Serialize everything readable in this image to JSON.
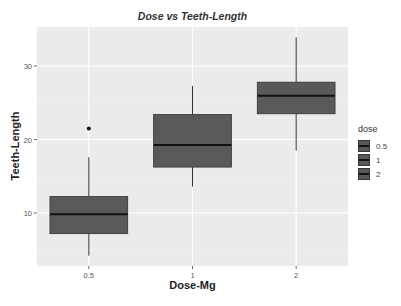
{
  "chart_data": {
    "type": "box",
    "title": "Dose vs Teeth-Length",
    "xlabel": "Dose-Mg",
    "ylabel": "Teeth-Length",
    "categories": [
      "0.5",
      "1",
      "2"
    ],
    "y_ticks": [
      10,
      20,
      30
    ],
    "ylim": [
      2.8,
      35.3
    ],
    "grid": true,
    "legend": {
      "title": "dose",
      "position": "right",
      "entries": [
        "0.5",
        "1",
        "2"
      ]
    },
    "series": [
      {
        "name": "0.5",
        "whisker_low": 4.2,
        "q1": 7.2,
        "median": 9.85,
        "q3": 12.25,
        "whisker_high": 17.6,
        "outliers": [
          21.5
        ]
      },
      {
        "name": "1",
        "whisker_low": 13.6,
        "q1": 16.25,
        "median": 19.25,
        "q3": 23.4,
        "whisker_high": 27.3,
        "outliers": []
      },
      {
        "name": "2",
        "whisker_low": 18.5,
        "q1": 23.5,
        "median": 25.95,
        "q3": 27.8,
        "whisker_high": 33.9,
        "outliers": []
      }
    ],
    "colors": {
      "panel": "#ebebeb",
      "grid": "#ffffff",
      "box_fill": "#595959",
      "box_line": "#333333",
      "median": "#111111"
    }
  }
}
